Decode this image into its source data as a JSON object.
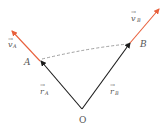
{
  "diagram": {
    "colors": {
      "position_vector": "#1a1a1a",
      "velocity_vector": "#e8603c",
      "dashed_line": "#888888",
      "label": "#555555"
    },
    "points": {
      "origin": {
        "label": "O",
        "x": 82,
        "y": 109
      },
      "A": {
        "label": "A",
        "x": 40,
        "y": 61
      },
      "B": {
        "label": "B",
        "x": 130,
        "y": 42
      }
    },
    "vectors": {
      "r_A": {
        "symbol": "r",
        "subscript": "A",
        "from": "O",
        "to": "A"
      },
      "r_B": {
        "symbol": "r",
        "subscript": "B",
        "from": "O",
        "to": "B"
      },
      "v_A": {
        "symbol": "v",
        "subscript": "A",
        "from": "A"
      },
      "v_B": {
        "symbol": "v",
        "subscript": "B",
        "from": "B"
      }
    },
    "connector": {
      "from": "A",
      "to": "B",
      "style": "dashed"
    }
  }
}
